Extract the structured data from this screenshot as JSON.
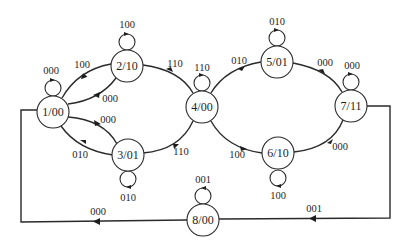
{
  "diagram": {
    "type": "state-machine",
    "states": [
      {
        "id": "1",
        "label": "1/00",
        "x": 53,
        "y": 112,
        "self_loop": "000"
      },
      {
        "id": "2",
        "label": "2/10",
        "x": 127,
        "y": 66,
        "self_loop": "100"
      },
      {
        "id": "3",
        "label": "3/01",
        "x": 128,
        "y": 155,
        "self_loop": "010"
      },
      {
        "id": "4",
        "label": "4/00",
        "x": 202,
        "y": 107,
        "self_loop": "110"
      },
      {
        "id": "5",
        "label": "5/01",
        "x": 277,
        "y": 62,
        "self_loop": "010"
      },
      {
        "id": "6",
        "label": "6/10",
        "x": 278,
        "y": 153,
        "self_loop": "100"
      },
      {
        "id": "7",
        "label": "7/11",
        "x": 351,
        "y": 106,
        "self_loop": "000"
      },
      {
        "id": "8",
        "label": "8/00",
        "x": 203,
        "y": 220,
        "self_loop": "001"
      }
    ],
    "transitions": [
      {
        "from": "1",
        "to": "2",
        "label": "100"
      },
      {
        "from": "2",
        "to": "1",
        "label": "000"
      },
      {
        "from": "1",
        "to": "3",
        "label": "010"
      },
      {
        "from": "3",
        "to": "1",
        "label": "000"
      },
      {
        "from": "2",
        "to": "4",
        "label": "110"
      },
      {
        "from": "3",
        "to": "4",
        "label": "110"
      },
      {
        "from": "4",
        "to": "5",
        "label": "010"
      },
      {
        "from": "4",
        "to": "6",
        "label": "100"
      },
      {
        "from": "5",
        "to": "7",
        "label": "000"
      },
      {
        "from": "6",
        "to": "7",
        "label": "000"
      },
      {
        "from": "7",
        "to": "8",
        "label": "001"
      },
      {
        "from": "8",
        "to": "1",
        "label": "000"
      }
    ]
  },
  "labels": {
    "s1": "1/00",
    "s2": "2/10",
    "s3": "3/01",
    "s4": "4/00",
    "s5": "5/01",
    "s6": "6/10",
    "s7": "7/11",
    "s8": "8/00",
    "loop1": "000",
    "loop2": "100",
    "loop3": "010",
    "loop4": "110",
    "loop5": "010",
    "loop6": "100",
    "loop7": "000",
    "loop8": "001",
    "e12": "100",
    "e21": "000",
    "e13": "010",
    "e31": "000",
    "e24": "110",
    "e34": "110",
    "e45": "010",
    "e46": "100",
    "e57": "000",
    "e67": "000",
    "e78": "001",
    "e81": "000"
  }
}
